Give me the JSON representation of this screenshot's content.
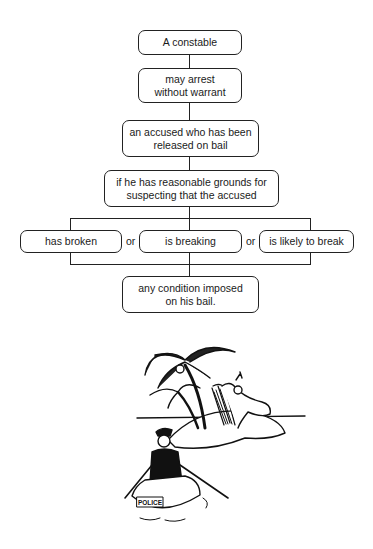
{
  "flowchart": {
    "nodes": [
      {
        "id": "constable",
        "lines": [
          "A constable"
        ]
      },
      {
        "id": "may-arrest",
        "lines": [
          "may arrest",
          "without warrant"
        ]
      },
      {
        "id": "accused",
        "lines": [
          "an accused who has been",
          "released on bail"
        ]
      },
      {
        "id": "grounds",
        "lines": [
          "if he has reasonable grounds for",
          "suspecting that the accused"
        ]
      },
      {
        "id": "has-broken",
        "lines": [
          "has broken"
        ]
      },
      {
        "id": "is-breaking",
        "lines": [
          "is breaking"
        ]
      },
      {
        "id": "likely-break",
        "lines": [
          "is likely to break"
        ]
      },
      {
        "id": "condition",
        "lines": [
          "any condition imposed",
          "on his bail."
        ]
      }
    ],
    "connectors": [
      "or",
      "or"
    ]
  },
  "illustration": {
    "description": "cartoon of a policeman rowing a boat toward an island where a man relaxes in a deck chair under palm trees",
    "boat_label": "POLICE"
  }
}
